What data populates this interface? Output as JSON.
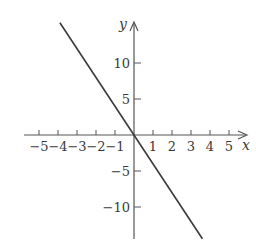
{
  "chart_data": {
    "type": "line",
    "title": "",
    "xlabel": "x",
    "ylabel": "y",
    "function": "y = -4x",
    "series": [
      {
        "name": "y = -4x",
        "x": [
          -3.9,
          3.6
        ],
        "y": [
          15.6,
          -14.4
        ],
        "color": "#3a3a3a"
      }
    ],
    "x_ticks": [
      -5,
      -4,
      -3,
      -2,
      -1,
      1,
      2,
      3,
      4,
      5
    ],
    "x_tick_labels": [
      "−5",
      "−4",
      "−3",
      "−2",
      "−1",
      "1",
      "2",
      "3",
      "4",
      "5"
    ],
    "y_ticks": [
      10,
      5,
      -5,
      -10
    ],
    "y_tick_labels": [
      "10",
      "5",
      "−5",
      "−10"
    ],
    "xlim": [
      -5.8,
      5.9
    ],
    "ylim": [
      -14.5,
      15.8
    ],
    "grid": false,
    "legend": "none"
  },
  "colors": {
    "ink": "#3a3a3a",
    "axis": "#555555",
    "background": "#ffffff"
  }
}
